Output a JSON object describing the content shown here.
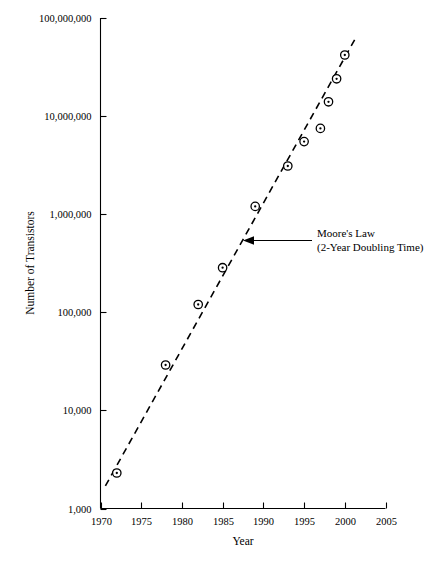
{
  "chart_data": {
    "type": "scatter",
    "title": "",
    "xlabel": "Year",
    "ylabel": "Number of Transistors",
    "yscale": "log",
    "xlim": [
      1970,
      2005
    ],
    "ylim": [
      1000,
      100000000
    ],
    "grid": false,
    "legend": null,
    "x_ticks": [
      "1970",
      "1975",
      "1980",
      "1985",
      "1990",
      "1995",
      "2000",
      "2005"
    ],
    "x_tick_values": [
      1970,
      1975,
      1980,
      1985,
      1990,
      1995,
      2000,
      2005
    ],
    "y_ticks": [
      "1,000",
      "10,000",
      "100,000",
      "1,000,000",
      "10,000,000",
      "100,000,000"
    ],
    "y_tick_values": [
      1000,
      10000,
      100000,
      1000000,
      10000000,
      100000000
    ],
    "points": [
      {
        "x": 1972,
        "y": 2300
      },
      {
        "x": 1978,
        "y": 29000
      },
      {
        "x": 1982,
        "y": 120000
      },
      {
        "x": 1985,
        "y": 285000
      },
      {
        "x": 1989,
        "y": 1200000
      },
      {
        "x": 1993,
        "y": 3100000
      },
      {
        "x": 1995,
        "y": 5500000
      },
      {
        "x": 1997,
        "y": 7500000
      },
      {
        "x": 1998,
        "y": 14000000
      },
      {
        "x": 1999,
        "y": 24000000
      },
      {
        "x": 2000,
        "y": 42000000
      }
    ],
    "trend_line": {
      "label": "Moore's Law",
      "style": "dashed",
      "doubling_years": 2,
      "start": {
        "x": 1970.6,
        "y": 1700
      },
      "end": {
        "x": 2001.3,
        "y": 62000000
      }
    },
    "annotation": {
      "line1": "Moore's Law",
      "line2": "(2-Year Doubling Time)",
      "arrow_points_to": "trend-line"
    }
  },
  "colors": {
    "background": "#ffffff",
    "ink": "#000000",
    "marker_fill": "#ffffff"
  }
}
